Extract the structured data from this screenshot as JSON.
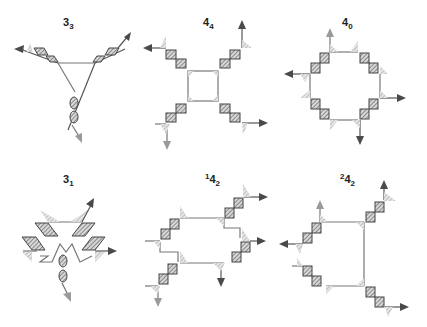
{
  "figure": {
    "panels": [
      {
        "id": "3_3",
        "base": "3",
        "sub": "3",
        "sup": ""
      },
      {
        "id": "4_4",
        "base": "4",
        "sub": "4",
        "sup": ""
      },
      {
        "id": "4_0",
        "base": "4",
        "sub": "0",
        "sup": ""
      },
      {
        "id": "3_1",
        "base": "3",
        "sub": "1",
        "sup": ""
      },
      {
        "id": "1_4_2",
        "base": "4",
        "sub": "2",
        "sup": "1"
      },
      {
        "id": "2_4_2",
        "base": "4",
        "sub": "2",
        "sup": "2"
      }
    ],
    "colors": {
      "dark_arrow": "#4a4a4a",
      "light_arrow": "#9a9a9a",
      "line": "#777777",
      "hatch": "#555555"
    }
  }
}
